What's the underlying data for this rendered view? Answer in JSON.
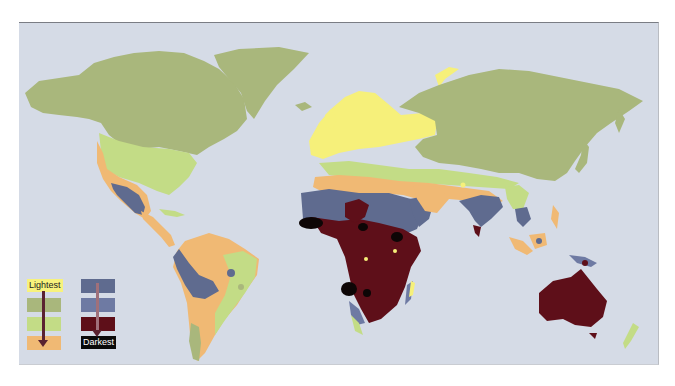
{
  "map": {
    "title": "Global distribution of human skin pigmentation",
    "background_color": "#d5dbe6",
    "zones": [
      {
        "key": "z1",
        "name": "Lightest",
        "color": "#f6f07a"
      },
      {
        "key": "z2",
        "name": "Light 2",
        "color": "#a9b77c"
      },
      {
        "key": "z3",
        "name": "Light 3",
        "color": "#c3dc86"
      },
      {
        "key": "z4",
        "name": "Medium",
        "color": "#f0b974"
      },
      {
        "key": "z5",
        "name": "Medium dark",
        "color": "#5f6b8f"
      },
      {
        "key": "z6",
        "name": "Dark",
        "color": "#6e7aa3"
      },
      {
        "key": "z7",
        "name": "Very dark",
        "color": "#5e0f19"
      },
      {
        "key": "z8",
        "name": "Darkest",
        "color": "#0d0606"
      }
    ]
  },
  "legend": {
    "lightest_label": "Lightest",
    "darkest_label": "Darkest",
    "left_column": [
      "#f6f07a",
      "#a9b77c",
      "#c3dc86",
      "#f0b974"
    ],
    "right_column": [
      "#5f6b8f",
      "#6e7aa3",
      "#5e0f19",
      "#0d0606"
    ],
    "arrow_color": "#5a2230"
  }
}
